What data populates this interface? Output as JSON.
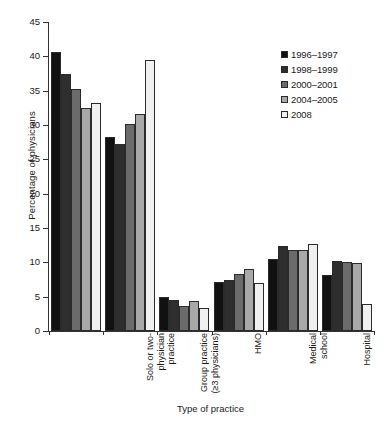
{
  "chart_data": {
    "type": "bar",
    "title": "",
    "xlabel": "Type of practice",
    "ylabel": "Percentage of physicians",
    "ylim": [
      0,
      45
    ],
    "yticks": [
      0,
      5,
      10,
      15,
      20,
      25,
      30,
      35,
      40,
      45
    ],
    "ytick_labels": [
      "0",
      "5",
      "10",
      "15",
      "20",
      "25",
      "30",
      "35",
      "40",
      "45"
    ],
    "grid": false,
    "legend_position": "top-right",
    "categories": [
      "Solo or two-\nphysician\npractice",
      "Group practice\n(≥3 physicians)",
      "HMO",
      "Medical\nschool",
      "Hospital",
      "Other"
    ],
    "series": [
      {
        "name": "1996–1997",
        "color": "#111111",
        "values": [
          40.6,
          28.2,
          4.9,
          7.2,
          10.5,
          8.1
        ]
      },
      {
        "name": "1998–1999",
        "color": "#2e2e2e",
        "values": [
          37.4,
          27.3,
          4.5,
          7.5,
          12.4,
          10.2
        ]
      },
      {
        "name": "2000–2001",
        "color": "#6b6b6b",
        "values": [
          35.2,
          30.2,
          3.7,
          8.3,
          11.8,
          10.1
        ]
      },
      {
        "name": "2004–2005",
        "color": "#a8a8a8",
        "values": [
          32.5,
          31.6,
          4.4,
          9.1,
          11.8,
          9.9
        ]
      },
      {
        "name": "2008",
        "color": "#f0f0f0",
        "values": [
          33.2,
          39.4,
          3.3,
          7.0,
          12.6,
          3.9
        ]
      }
    ]
  },
  "legend": {
    "items": [
      {
        "label": "1996–1997",
        "color": "#111111"
      },
      {
        "label": "1998–1999",
        "color": "#2e2e2e"
      },
      {
        "label": "2000–2001",
        "color": "#6b6b6b"
      },
      {
        "label": "2004–2005",
        "color": "#a8a8a8"
      },
      {
        "label": "2008",
        "color": "#f0f0f0"
      }
    ]
  }
}
